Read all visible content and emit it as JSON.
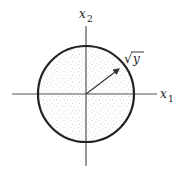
{
  "figure": {
    "type": "diagram",
    "axes": {
      "x": {
        "label": "x",
        "subscript": "1"
      },
      "y": {
        "label": "x",
        "subscript": "2"
      }
    },
    "radius_label": {
      "radical": "√",
      "symbol": "y"
    },
    "colors": {
      "axis": "#555555",
      "circle": "#222222",
      "fill_dots": "#9a9a9a",
      "arrow": "#333333",
      "background": "#ffffff"
    },
    "geometry": {
      "center": [
        86,
        94
      ],
      "radius": 48,
      "h_axis": [
        12,
        157
      ],
      "v_axis": [
        26,
        166
      ],
      "arrow_tip": [
        121,
        67
      ]
    }
  }
}
